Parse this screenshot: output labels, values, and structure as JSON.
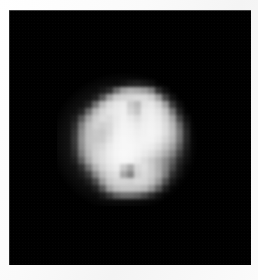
{
  "image": {
    "title": "Pixelated grayscale image of an irregular bright object",
    "subject": "bright irregular body (asteroid / small moon) on black sky background",
    "canvas_width": 258,
    "canvas_height": 280,
    "background_color": "#ffffff",
    "plate": {
      "name": "image-plate",
      "left": 9,
      "top": 10,
      "width": 242,
      "height": 255,
      "color": "#000000"
    },
    "object": {
      "name": "bright-object",
      "left": 64,
      "top": 80,
      "grid_cols": 18,
      "grid_rows": 17,
      "cell_size": 7,
      "peak_gray": 246,
      "background_gray": 4
    }
  },
  "chart_data": {
    "type": "heatmap",
    "xlabel": "",
    "ylabel": "",
    "colormap": "grayscale",
    "value_range": [
      0,
      255
    ],
    "grid": false,
    "legend": "none",
    "cell_size_px": 7,
    "origin_px": [
      64,
      80
    ],
    "rows": 17,
    "cols": 18,
    "values": [
      [
        0,
        0,
        0,
        0,
        0,
        0,
        0,
        0,
        8,
        18,
        22,
        16,
        10,
        0,
        0,
        0,
        0,
        0
      ],
      [
        0,
        0,
        0,
        0,
        0,
        10,
        30,
        96,
        150,
        168,
        162,
        150,
        120,
        40,
        10,
        0,
        0,
        0
      ],
      [
        0,
        0,
        0,
        0,
        14,
        70,
        150,
        196,
        206,
        210,
        214,
        214,
        200,
        150,
        60,
        12,
        0,
        0
      ],
      [
        0,
        0,
        0,
        18,
        96,
        176,
        212,
        226,
        232,
        196,
        176,
        222,
        228,
        206,
        150,
        50,
        8,
        0
      ],
      [
        0,
        0,
        16,
        90,
        170,
        206,
        222,
        230,
        236,
        206,
        186,
        230,
        234,
        222,
        190,
        110,
        26,
        0
      ],
      [
        0,
        10,
        70,
        150,
        196,
        214,
        212,
        228,
        238,
        228,
        214,
        232,
        238,
        230,
        206,
        156,
        60,
        10
      ],
      [
        0,
        22,
        110,
        176,
        200,
        196,
        206,
        230,
        240,
        236,
        228,
        236,
        240,
        234,
        214,
        176,
        96,
        22
      ],
      [
        0,
        30,
        124,
        180,
        190,
        186,
        206,
        234,
        242,
        240,
        234,
        238,
        242,
        236,
        216,
        182,
        110,
        30
      ],
      [
        0,
        34,
        130,
        182,
        188,
        190,
        216,
        238,
        244,
        242,
        238,
        240,
        240,
        230,
        206,
        174,
        104,
        28
      ],
      [
        0,
        30,
        124,
        178,
        196,
        206,
        228,
        240,
        244,
        244,
        240,
        236,
        232,
        214,
        186,
        150,
        80,
        20
      ],
      [
        0,
        22,
        108,
        170,
        200,
        214,
        232,
        242,
        246,
        244,
        238,
        228,
        216,
        192,
        160,
        118,
        52,
        12
      ],
      [
        0,
        10,
        74,
        150,
        196,
        214,
        230,
        240,
        244,
        240,
        228,
        212,
        192,
        164,
        126,
        80,
        26,
        6
      ],
      [
        0,
        0,
        26,
        96,
        166,
        202,
        222,
        232,
        190,
        150,
        206,
        216,
        196,
        164,
        120,
        60,
        14,
        0
      ],
      [
        0,
        0,
        8,
        40,
        118,
        176,
        206,
        216,
        150,
        110,
        196,
        210,
        196,
        166,
        110,
        34,
        8,
        0
      ],
      [
        0,
        0,
        0,
        12,
        56,
        140,
        190,
        206,
        206,
        202,
        210,
        206,
        186,
        140,
        66,
        14,
        0,
        0
      ],
      [
        0,
        0,
        0,
        0,
        16,
        72,
        150,
        182,
        190,
        190,
        186,
        176,
        140,
        80,
        22,
        0,
        0,
        0
      ],
      [
        0,
        0,
        0,
        0,
        0,
        14,
        44,
        80,
        96,
        96,
        86,
        62,
        34,
        10,
        0,
        0,
        0,
        0
      ]
    ]
  }
}
